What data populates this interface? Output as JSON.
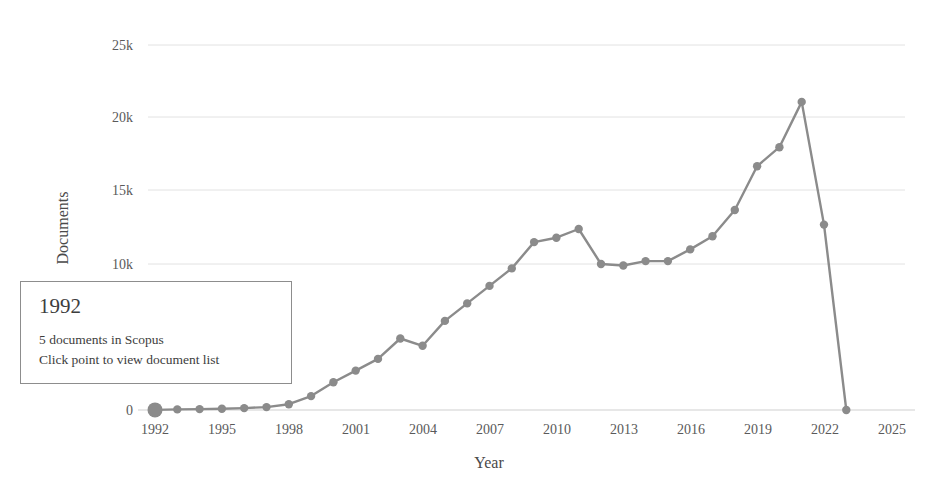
{
  "chart_data": {
    "type": "line",
    "title": "",
    "xlabel": "Year",
    "ylabel": "Documents",
    "xlim": [
      1991,
      2026
    ],
    "ylim": [
      0,
      26000
    ],
    "grid": true,
    "legend": false,
    "x_ticks": [
      "1992",
      "1995",
      "1998",
      "2001",
      "2004",
      "2007",
      "2010",
      "2013",
      "2016",
      "2019",
      "2022",
      "2025"
    ],
    "y_ticks": [
      "0",
      "10k",
      "15k",
      "20k",
      "25k"
    ],
    "y_tick_values": [
      0,
      10000,
      15000,
      20000,
      25000
    ],
    "x": [
      1992,
      1993,
      1994,
      1995,
      1996,
      1997,
      1998,
      1999,
      2000,
      2001,
      2002,
      2003,
      2004,
      2005,
      2006,
      2007,
      2008,
      2009,
      2010,
      2011,
      2012,
      2013,
      2014,
      2015,
      2016,
      2017,
      2018,
      2019,
      2020,
      2021,
      2022,
      2023
    ],
    "values": [
      5,
      40,
      60,
      90,
      130,
      200,
      400,
      950,
      1900,
      2700,
      3500,
      4900,
      4400,
      6100,
      7300,
      8500,
      9700,
      11500,
      11800,
      12400,
      10000,
      9900,
      10200,
      10200,
      11000,
      11900,
      13700,
      16700,
      18000,
      21100,
      12700,
      0
    ],
    "highlighted_point": {
      "year": 1992,
      "value": 5
    },
    "series": [
      {
        "name": "Documents",
        "color": "#8b8b8b"
      }
    ]
  },
  "tooltip": {
    "title": "1992",
    "line1": "5 documents in Scopus",
    "line2": "Click point to view document list"
  },
  "colors": {
    "line": "#8b8b8b",
    "marker": "#8b8b8b",
    "grid": "#e2e2e2",
    "text": "#4a4a4a",
    "background": "#ffffff",
    "tooltip_border": "#8d8d8d"
  }
}
